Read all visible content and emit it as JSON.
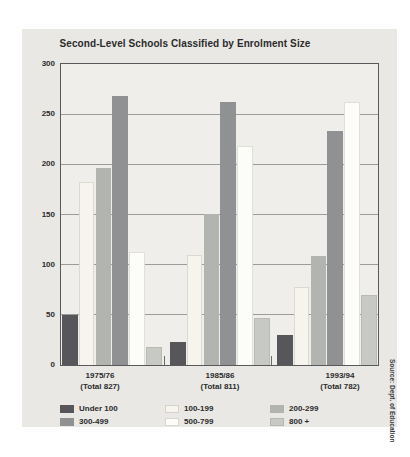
{
  "page": {
    "background": "#ffffff",
    "panel_background": "#e9e8e5"
  },
  "chart_data": {
    "type": "bar",
    "title": "Second-Level Schools Classified by Enrolment Size",
    "groups": [
      {
        "year": "1975/76",
        "total": "(Total 827)"
      },
      {
        "year": "1985/86",
        "total": "(Total 811)"
      },
      {
        "year": "1993/94",
        "total": "(Total 782)"
      }
    ],
    "series": [
      {
        "name": "Under 100",
        "color": "#57565a",
        "values": [
          50,
          23,
          30
        ]
      },
      {
        "name": "100-199",
        "color": "#f6f4ec",
        "values": [
          182,
          110,
          78
        ]
      },
      {
        "name": "200-299",
        "color": "#b2b4b0",
        "values": [
          196,
          151,
          109
        ]
      },
      {
        "name": "300-499",
        "color": "#8f9193",
        "values": [
          268,
          262,
          233
        ]
      },
      {
        "name": "500-799",
        "color": "#fcfcf8",
        "values": [
          113,
          218,
          262
        ]
      },
      {
        "name": "800 +",
        "color": "#c7c9c5",
        "values": [
          18,
          47,
          70
        ]
      }
    ],
    "ylim": [
      0,
      300
    ],
    "yticks": [
      0,
      50,
      100,
      150,
      200,
      250,
      300
    ],
    "grid": "horizontal",
    "legend_position": "bottom",
    "source": "Source: Dept. of Education"
  }
}
